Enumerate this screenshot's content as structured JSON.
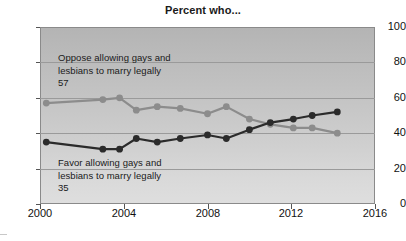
{
  "chart": {
    "title": "Percent who...",
    "axis": {
      "ylabel": "",
      "xlabel": "",
      "yticks": [
        "0",
        "20",
        "40",
        "60",
        "80",
        "100"
      ],
      "xticks": [
        "2000",
        "2004",
        "2008",
        "2012",
        "2016"
      ]
    },
    "annotations": {
      "oppose_label": "Oppose allowing gays and\nlesbians to marry legally",
      "oppose_value": "57",
      "favor_label": "Favor allowing gays and\nlesbians to marry legally",
      "favor_value": "35"
    },
    "colors": {
      "oppose_series": "#8c8c8c",
      "favor_series": "#2b2b2b",
      "plot_background_top": "#b4b4b4",
      "plot_background_bottom": "#dedede",
      "gridline": "#9a9a9a",
      "axis": "#555555",
      "text": "#1a1a1a"
    }
  },
  "chart_data": {
    "type": "line",
    "title": "Percent who...",
    "xlabel": "",
    "ylabel": "",
    "xlim": [
      2000,
      2016
    ],
    "ylim": [
      0,
      100
    ],
    "grid": true,
    "legend_position": "inline-annotation",
    "x": [
      2000.3,
      2003.0,
      2003.8,
      2004.6,
      2005.6,
      2006.7,
      2008.0,
      2008.9,
      2010.0,
      2011.0,
      2012.1,
      2013.0,
      2014.2
    ],
    "series": [
      {
        "name": "Oppose allowing gays and lesbians to marry legally",
        "color": "#8c8c8c",
        "values": [
          57,
          59,
          60,
          53,
          55,
          54,
          51,
          55,
          48,
          45,
          43,
          43,
          40
        ],
        "label_value": 57
      },
      {
        "name": "Favor allowing gays and lesbians to marry legally",
        "color": "#2b2b2b",
        "values": [
          35,
          31,
          31,
          37,
          35,
          37,
          39,
          37,
          42,
          46,
          48,
          50,
          52
        ],
        "label_value": 35
      }
    ]
  }
}
